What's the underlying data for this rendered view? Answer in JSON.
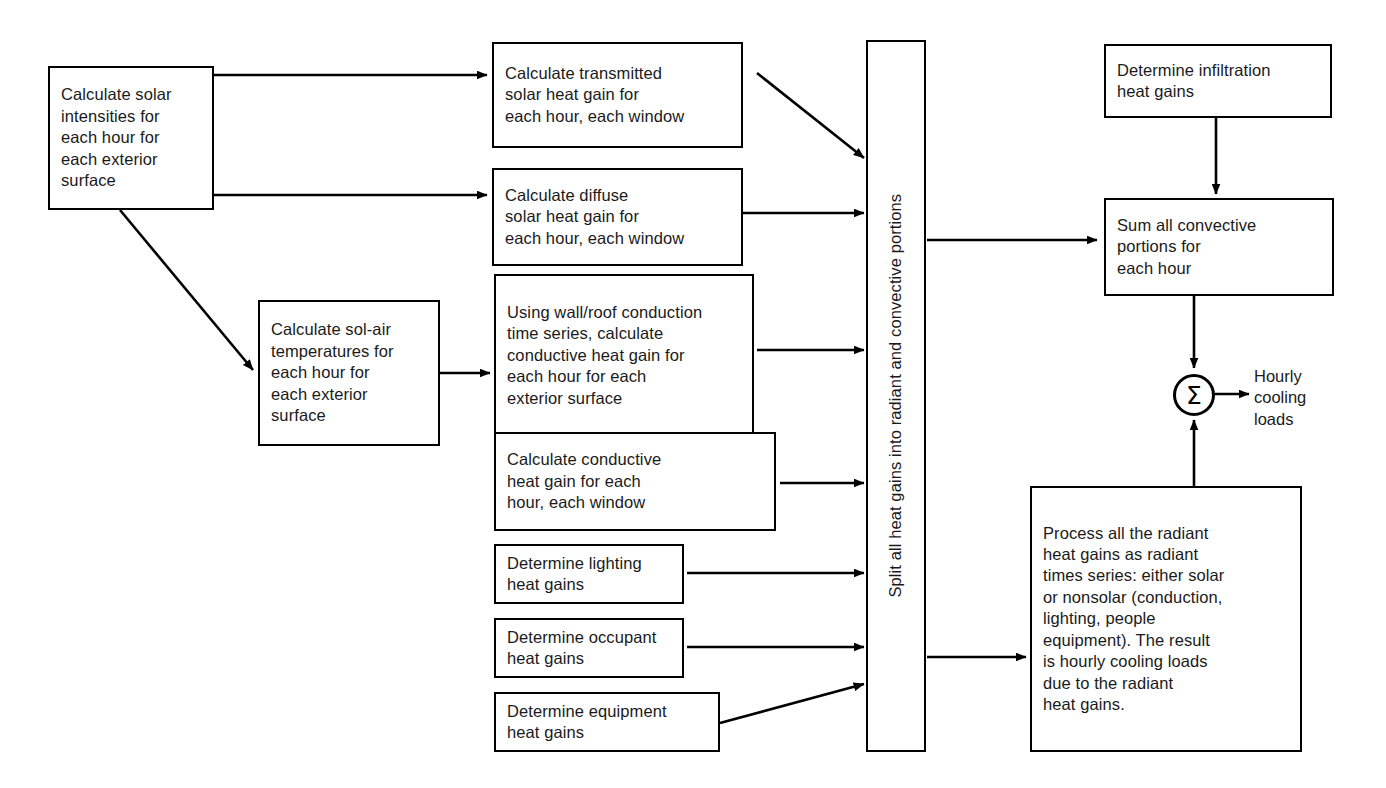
{
  "diagram": {
    "stroke_color": "#000000",
    "text_color": "#1a1a1a",
    "background": "#ffffff"
  },
  "nodes": {
    "solar_intensities": "Calculate solar\nintensities for\neach hour for\neach exterior\nsurface",
    "transmitted_solar": "Calculate transmitted\nsolar heat gain for\neach hour, each window",
    "diffuse_solar": "Calculate diffuse\nsolar heat gain for\neach hour, each window",
    "sol_air": "Calculate sol-air\ntemperatures for\neach hour for\neach exterior\nsurface",
    "wall_roof_conduction": "Using wall/roof conduction\ntime series, calculate\nconductive heat gain for\neach hour for each\nexterior surface",
    "window_conduction": "Calculate conductive\nheat gain for each\nhour, each window",
    "lighting": "Determine lighting\nheat gains",
    "occupant": "Determine occupant\nheat gains",
    "equipment": "Determine equipment\nheat gains",
    "split_column": "Split all heat gains into radiant and convective portions",
    "infiltration": "Determine infiltration\nheat gains",
    "sum_convective": "Sum all convective\nportions for\neach hour",
    "radiant_process": "Process all the radiant\nheat gains as radiant\ntimes series: either solar\nor nonsolar (conduction,\nlighting, people\nequipment). The result\nis hourly cooling loads\ndue to the radiant\nheat gains.",
    "summation_symbol": "Σ",
    "output_label": "Hourly\ncooling\nloads"
  }
}
